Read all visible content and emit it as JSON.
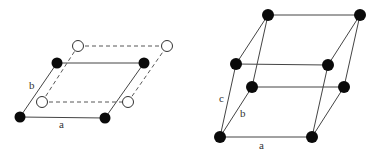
{
  "colors": {
    "line": "#444444",
    "atom_filled": "#0a0a0a",
    "atom_open_fill": "#ffffff",
    "atom_open_stroke": "#333333",
    "label": "#333333"
  },
  "figures": [
    {
      "name": "2d-lattice",
      "labels": {
        "a": "a",
        "b": "b"
      },
      "filled_atoms": [
        [
          20,
          117
        ],
        [
          105,
          118
        ],
        [
          57,
          63
        ],
        [
          144,
          63
        ]
      ],
      "open_atoms": [
        [
          42,
          102
        ],
        [
          128,
          102
        ],
        [
          78,
          46
        ],
        [
          167,
          46
        ]
      ]
    },
    {
      "name": "3d-lattice",
      "labels": {
        "a": "a",
        "b": "b",
        "c": "c"
      },
      "atoms": [
        [
          220,
          137
        ],
        [
          312,
          137
        ],
        [
          252,
          87
        ],
        [
          344,
          87
        ],
        [
          236,
          64
        ],
        [
          328,
          65
        ],
        [
          268,
          15
        ],
        [
          360,
          15
        ]
      ]
    }
  ]
}
